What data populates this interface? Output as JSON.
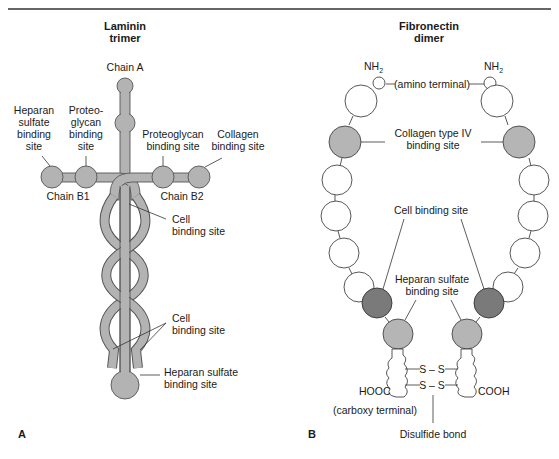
{
  "figure": {
    "colors": {
      "laminin_fill": "#b3b3b3",
      "fibronectin_light": "#b5b5b5",
      "fibronectin_dark": "#7a7a7a",
      "fibronectin_white": "#ffffff",
      "outline": "#444444",
      "top_rule": "#333333"
    },
    "panel_a": {
      "panel_letter": "A",
      "title_line1": "Laminin",
      "title_line2": "trimer",
      "chain_a": "Chain A",
      "chain_b1": "Chain B1",
      "chain_b2": "Chain B2",
      "heparan_top": [
        "Heparan",
        "sulfate",
        "binding",
        "site"
      ],
      "proteoglycan_left": [
        "Proteo-",
        "glycan",
        "binding",
        "site"
      ],
      "proteoglycan_right": [
        "Proteoglycan",
        "binding site"
      ],
      "collagen": [
        "Collagen",
        "binding site"
      ],
      "cell_upper": [
        "Cell",
        "binding site"
      ],
      "cell_lower": [
        "Cell",
        "binding site"
      ],
      "heparan_bottom": [
        "Heparan sulfate",
        "binding site"
      ]
    },
    "panel_b": {
      "panel_letter": "B",
      "title_line1": "Fibronectin",
      "title_line2": "dimer",
      "nh2_left": "NH",
      "nh2_right": "NH",
      "subscript": "2",
      "amino_terminal": "(amino terminal)",
      "collagen_iv": [
        "Collagen type IV",
        "binding site"
      ],
      "cell_binding": "Cell binding site",
      "heparan": [
        "Heparan sulfate",
        "binding site"
      ],
      "disulfide_top": "S – S",
      "disulfide_bottom": "S – S",
      "hooc": "HOOC",
      "cooh": "COOH",
      "carboxy_terminal": "(carboxy terminal)",
      "disulfide_bond": "Disulfide bond"
    }
  }
}
